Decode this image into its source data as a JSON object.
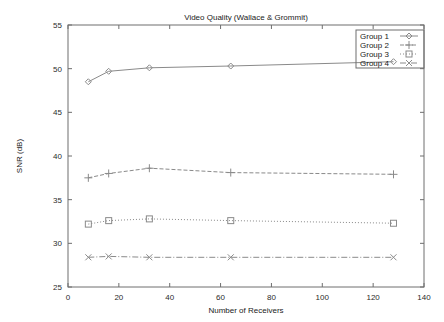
{
  "chart_data": {
    "type": "line",
    "title": "Video Quality (Wallace & Grommit)",
    "xlabel": "Number of Receivers",
    "ylabel": "SNR (dB)",
    "xlim": [
      0,
      140
    ],
    "ylim": [
      25,
      55
    ],
    "xticks": [
      0,
      20,
      40,
      60,
      80,
      100,
      120,
      140
    ],
    "yticks": [
      25,
      30,
      35,
      40,
      45,
      50,
      55
    ],
    "xtick_labels": [
      "0",
      "20",
      "40",
      "60",
      "80",
      "100",
      "120",
      "140"
    ],
    "ytick_labels": [
      "25",
      "30",
      "35",
      "40",
      "45",
      "50",
      "55"
    ],
    "grid": false,
    "legend_position": "top-right",
    "x": [
      8,
      16,
      32,
      64,
      128
    ],
    "series": [
      {
        "name": "Group 1",
        "marker": "diamond",
        "linestyle": "solid",
        "color": "#8a8a8a",
        "values": [
          48.5,
          49.7,
          50.1,
          50.3,
          50.8
        ]
      },
      {
        "name": "Group 2",
        "marker": "plus",
        "linestyle": "dashed",
        "color": "#8a8a8a",
        "values": [
          37.5,
          38.0,
          38.6,
          38.1,
          37.9
        ]
      },
      {
        "name": "Group 3",
        "marker": "square",
        "linestyle": "dotted",
        "color": "#8a8a8a",
        "values": [
          32.2,
          32.6,
          32.8,
          32.6,
          32.3
        ]
      },
      {
        "name": "Group 4",
        "marker": "cross",
        "linestyle": "dashdot",
        "color": "#8a8a8a",
        "values": [
          28.4,
          28.5,
          28.4,
          28.4,
          28.4
        ]
      }
    ]
  },
  "legend": {
    "items": [
      {
        "label": "Group 1"
      },
      {
        "label": "Group 2"
      },
      {
        "label": "Group 3"
      },
      {
        "label": "Group 4"
      }
    ]
  }
}
